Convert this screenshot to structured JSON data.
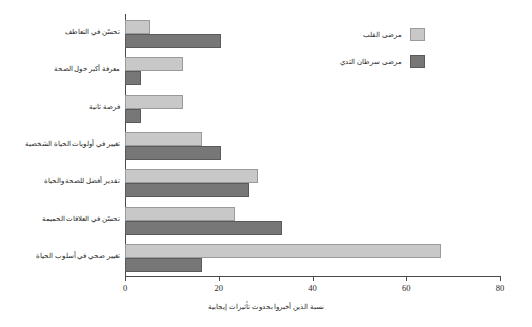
{
  "chart_data": {
    "type": "bar",
    "orientation": "horizontal",
    "title": "",
    "xlabel": "نسبة الذين أخبروا بحدوث تأثيرات إيجابية",
    "ylabel": "",
    "xlim": [
      0,
      80
    ],
    "xticks": [
      0,
      20,
      40,
      60,
      80
    ],
    "xtick_labels": [
      "0",
      "20",
      "40",
      "60",
      "80"
    ],
    "grid": false,
    "legend_position": "top-right",
    "categories": [
      "تحسّن في التعاطف",
      "معرفة أكبر حول الصحة",
      "فرصة ثانية",
      "تغيير في أولويات الحياة الشخصية",
      "تقدير أفضل للصحة والحياة",
      "تحسّن في العلاقات الحميمة",
      "تغيير صحي في أسلوب الحياة"
    ],
    "series": [
      {
        "name": "مرضى القلب",
        "color": "#c8c8c8",
        "values": [
          5,
          12,
          12,
          16,
          28,
          23,
          67
        ]
      },
      {
        "name": "مرضى سرطان الثدي",
        "color": "#777777",
        "values": [
          20,
          3,
          3,
          20,
          26,
          33,
          16
        ]
      }
    ]
  },
  "legend": {
    "items": [
      {
        "label": "مرضى القلب",
        "swatch": "light"
      },
      {
        "label": "مرضى سرطان الثدي",
        "swatch": "dark"
      }
    ]
  }
}
